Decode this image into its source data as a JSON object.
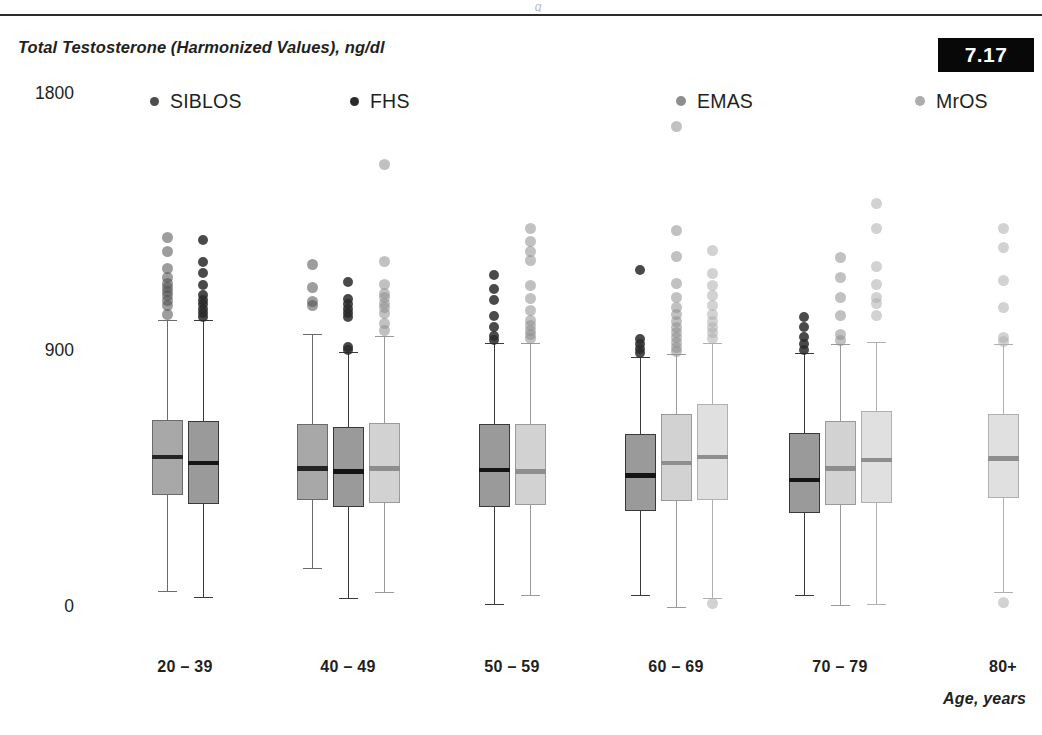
{
  "figure": {
    "top_rule": true,
    "partial_glyph": "g",
    "badge_value": "7.17",
    "badge_bg": "#080808",
    "badge_fg": "#ffffff"
  },
  "chart_data": {
    "type": "box",
    "title": "",
    "ylabel": "Total Testosterone (Harmonized Values), ng/dl",
    "xlabel": "Age, years",
    "ylim": [
      0,
      1800
    ],
    "yticks": [
      0,
      900,
      1800
    ],
    "ytick_labels": [
      "0",
      "900",
      "1800"
    ],
    "grid": false,
    "legend_position": "top",
    "categories": [
      "20 – 39",
      "40 – 49",
      "50 – 59",
      "60 – 69",
      "70 – 79",
      "80+"
    ],
    "series": [
      {
        "name": "SIBLOS",
        "color": "#a8a8a8",
        "edge": "#6b6b6b",
        "dot": "#4d4d4d"
      },
      {
        "name": "FHS",
        "color": "#9a9a9a",
        "edge": "#3a3a3a",
        "dot": "#2a2a2a"
      },
      {
        "name": "EMAS",
        "color": "#d2d2d2",
        "edge": "#9a9a9a",
        "dot": "#8e8e8e"
      },
      {
        "name": "MrOS",
        "color": "#e0e0e0",
        "edge": "#b0b0b0",
        "dot": "#adadad"
      }
    ],
    "boxes": [
      {
        "group": "20 – 39",
        "series": "SIBLOS",
        "min": 60,
        "q1": 395,
        "median": 530,
        "q3": 660,
        "max": 1010,
        "outliers": [
          1030,
          1060,
          1080,
          1095,
          1110,
          1125,
          1140,
          1160,
          1190,
          1250,
          1300
        ]
      },
      {
        "group": "20 – 39",
        "series": "FHS",
        "min": 40,
        "q1": 365,
        "median": 510,
        "q3": 655,
        "max": 1010,
        "outliers": [
          1020,
          1035,
          1050,
          1065,
          1080,
          1100,
          1135,
          1175,
          1215,
          1290
        ]
      },
      {
        "group": "40 – 49",
        "series": "SIBLOS",
        "min": 140,
        "q1": 380,
        "median": 490,
        "q3": 645,
        "max": 960,
        "outliers": [
          1060,
          1075,
          1125,
          1205
        ]
      },
      {
        "group": "40 – 49",
        "series": "FHS",
        "min": 35,
        "q1": 355,
        "median": 480,
        "q3": 635,
        "max": 900,
        "outliers": [
          905,
          915,
          1020,
          1035,
          1050,
          1065,
          1085,
          1145
        ]
      },
      {
        "group": "40 – 49",
        "series": "EMAS",
        "min": 55,
        "q1": 370,
        "median": 490,
        "q3": 650,
        "max": 955,
        "outliers": [
          975,
          1000,
          1035,
          1055,
          1070,
          1090,
          1105,
          1135,
          1215,
          1555
        ]
      },
      {
        "group": "50 – 59",
        "series": "FHS",
        "min": 15,
        "q1": 355,
        "median": 485,
        "q3": 645,
        "max": 930,
        "outliers": [
          940,
          955,
          985,
          1025,
          1080,
          1120,
          1170
        ]
      },
      {
        "group": "50 – 59",
        "series": "EMAS",
        "min": 45,
        "q1": 360,
        "median": 480,
        "q3": 645,
        "max": 930,
        "outliers": [
          945,
          960,
          975,
          990,
          1010,
          1045,
          1085,
          1130,
          1220,
          1250,
          1285,
          1330
        ]
      },
      {
        "group": "60 – 69",
        "series": "FHS",
        "min": 45,
        "q1": 340,
        "median": 465,
        "q3": 610,
        "max": 880,
        "outliers": [
          895,
          910,
          925,
          945,
          1185
        ]
      },
      {
        "group": "60 – 69",
        "series": "EMAS",
        "min": 5,
        "q1": 375,
        "median": 510,
        "q3": 680,
        "max": 890,
        "outliers": [
          900,
          915,
          930,
          950,
          965,
          985,
          1005,
          1030,
          1055,
          1090,
          1140,
          1235,
          1325,
          1690
        ]
      },
      {
        "group": "60 – 69",
        "series": "MrOS",
        "min": 35,
        "q1": 380,
        "median": 530,
        "q3": 715,
        "max": 930,
        "outliers": [
          15,
          945,
          965,
          985,
          1005,
          1030,
          1060,
          1095,
          1130,
          1175,
          1255
        ]
      },
      {
        "group": "70 – 79",
        "series": "FHS",
        "min": 45,
        "q1": 335,
        "median": 450,
        "q3": 615,
        "max": 895,
        "outliers": [
          905,
          925,
          950,
          985,
          1020
        ]
      },
      {
        "group": "70 – 79",
        "series": "EMAS",
        "min": 10,
        "q1": 360,
        "median": 490,
        "q3": 655,
        "max": 925,
        "outliers": [
          940,
          960,
          1025,
          1090,
          1160,
          1230
        ]
      },
      {
        "group": "70 – 79",
        "series": "MrOS",
        "min": 15,
        "q1": 370,
        "median": 520,
        "q3": 690,
        "max": 935,
        "outliers": [
          1025,
          1070,
          1090,
          1135,
          1200,
          1330,
          1420
        ]
      },
      {
        "group": "80+",
        "series": "MrOS",
        "min": 55,
        "q1": 385,
        "median": 525,
        "q3": 680,
        "max": 925,
        "outliers": [
          20,
          935,
          950,
          1055,
          1150,
          1265,
          1330
        ]
      }
    ]
  }
}
